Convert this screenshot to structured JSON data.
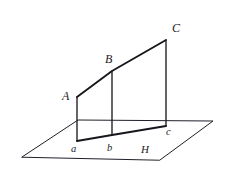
{
  "figure": {
    "background_color": "#ffffff",
    "stroke_color": "#1b1b22",
    "canvas": {
      "width": 235,
      "height": 171
    },
    "plane": {
      "name": "H",
      "label": "H",
      "label_position": {
        "x": 141,
        "y": 144
      },
      "outline_points": "22,157 78,120 213,121 160,160",
      "fill": "#ffffff"
    },
    "upper_polyline": {
      "name": "A-B-C upper slanted edge",
      "points": "77,97 112,71 166,40"
    },
    "base_polyline": {
      "name": "a-b-c base edge on plane",
      "points": "77,141 112,135 166,126"
    },
    "verticals": [
      {
        "name": "A-a",
        "points": "77,97 77,141"
      },
      {
        "name": "B-b",
        "points": "112,71 112,135"
      },
      {
        "name": "C-c",
        "points": "166,40 166,126"
      }
    ],
    "labels": [
      {
        "id": "C",
        "text": "C",
        "x": 172,
        "y": 22,
        "class": "upper"
      },
      {
        "id": "B",
        "text": "B",
        "x": 105,
        "y": 53,
        "class": "upper"
      },
      {
        "id": "A",
        "text": "A",
        "x": 62,
        "y": 90,
        "class": "upper"
      },
      {
        "id": "c",
        "text": "c",
        "x": 166,
        "y": 127,
        "class": "lower"
      },
      {
        "id": "a",
        "text": "a",
        "x": 71,
        "y": 144,
        "class": "lower"
      },
      {
        "id": "b",
        "text": "b",
        "x": 107,
        "y": 143,
        "class": "lower"
      },
      {
        "id": "H",
        "text": "H",
        "x": 141,
        "y": 144,
        "class": "plane"
      }
    ]
  }
}
